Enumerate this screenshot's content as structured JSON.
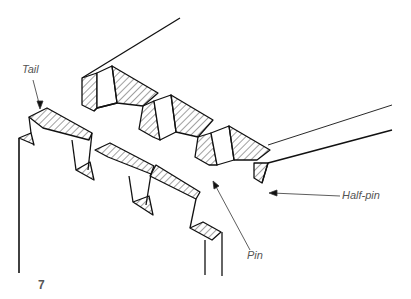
{
  "figure": {
    "number": "7",
    "labels": {
      "tail": "Tail",
      "pin": "Pin",
      "half_pin": "Half-pin"
    },
    "colors": {
      "line": "#111111",
      "label": "#555555",
      "background": "#ffffff"
    }
  }
}
